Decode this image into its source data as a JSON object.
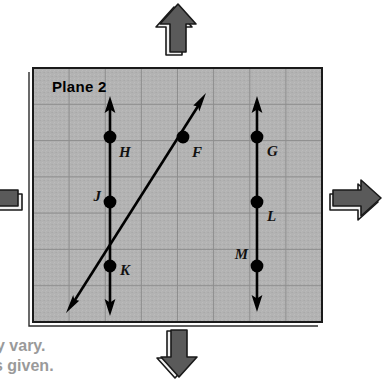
{
  "figure": {
    "plane_label": "Plane 2",
    "colors": {
      "plane_fill": "#b3b3b3",
      "plane_fill_dark": "#a8a8a8",
      "grid_line": "#8e8e8e",
      "plane_border": "#1a1a1a",
      "line_stroke": "#000000",
      "point_fill": "#000000",
      "arrow_fill": "#5a5a5a",
      "arrow_outline": "#1a1a1a",
      "arrow_face": "#f2f2f2",
      "caption_text": "#9a9a9a",
      "background": "#ffffff"
    },
    "plane_box": {
      "x": 33,
      "y": 68,
      "width": 289,
      "height": 254
    },
    "grid": {
      "columns": 8,
      "rows": 7,
      "cell_size": 36.2,
      "visible": true
    },
    "lines": [
      {
        "id": "line-vertical-left",
        "name": "line-HJK",
        "type": "double-arrow",
        "orientation": "vertical",
        "x1": 110,
        "y1": 100,
        "x2": 110,
        "y2": 314
      },
      {
        "id": "line-diagonal",
        "name": "line-KF",
        "type": "double-arrow",
        "orientation": "diagonal",
        "x1": 67,
        "y1": 312,
        "x2": 206,
        "y2": 94
      },
      {
        "id": "line-vertical-right",
        "name": "line-GLM",
        "type": "double-arrow",
        "orientation": "vertical",
        "x1": 257,
        "y1": 100,
        "x2": 257,
        "y2": 310
      }
    ],
    "points": [
      {
        "label": "H",
        "cx": 110,
        "cy": 137,
        "lx": 119,
        "ly": 157,
        "anchor": "start"
      },
      {
        "label": "J",
        "cx": 110,
        "cy": 202,
        "lx": 101,
        "ly": 201,
        "anchor": "end"
      },
      {
        "label": "K",
        "cx": 110,
        "cy": 266,
        "lx": 120,
        "ly": 275,
        "anchor": "start"
      },
      {
        "label": "F",
        "cx": 183,
        "cy": 137,
        "lx": 192,
        "ly": 157,
        "anchor": "start"
      },
      {
        "label": "G",
        "cx": 257,
        "cy": 137,
        "lx": 267,
        "ly": 156,
        "anchor": "start"
      },
      {
        "label": "L",
        "cx": 257,
        "cy": 202,
        "lx": 267,
        "ly": 221,
        "anchor": "start"
      },
      {
        "label": "M",
        "cx": 257,
        "cy": 266,
        "lx": 248,
        "ly": 259,
        "anchor": "end"
      }
    ],
    "direction_arrows": [
      {
        "name": "plane-extend-arrow-up",
        "direction": "up",
        "cx": 178,
        "cy": 32
      },
      {
        "name": "plane-extend-arrow-right",
        "direction": "right",
        "cx": 353,
        "cy": 199
      },
      {
        "name": "plane-extend-arrow-down",
        "direction": "down",
        "cx": 178,
        "cy": 352
      },
      {
        "name": "plane-extend-arrow-left",
        "direction": "left",
        "cx": 12,
        "cy": 199
      }
    ],
    "caption_lines": [
      {
        "text": "y vary.",
        "x": 0,
        "y": 351
      },
      {
        "text": "s given.",
        "x": 0,
        "y": 371
      }
    ]
  }
}
